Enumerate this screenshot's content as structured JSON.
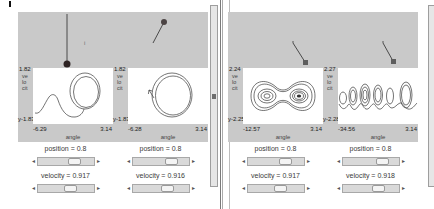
{
  "colors": {
    "canvas_bg": "#c9c9c9",
    "plot_bg": "#ffffff",
    "trace": "#3a3a3a",
    "slider_track": "#d9d9d9"
  },
  "canvas_annotation": "i",
  "ui": {
    "arrow_left": "◂",
    "arrow_right": "▸"
  },
  "panels": [
    {
      "plots": [
        {
          "y_max": "1.82",
          "ylabel_stack": "velocit",
          "ylabel_tail": "y",
          "y_min": "-1.83",
          "x_min": "-6.29",
          "x_max": "3.14",
          "xlabel": "angle"
        },
        {
          "y_max": "1.82",
          "ylabel_stack": "velocit",
          "ylabel_tail": "y",
          "y_min": "-1.83",
          "x_min": "-6.28",
          "x_max": "3.14",
          "xlabel": "angle"
        }
      ],
      "controls": [
        {
          "position": "position = 0.8",
          "velocity": "velocity = 0.917"
        },
        {
          "position": "position = 0.8",
          "velocity": "velocity = 0.916"
        }
      ]
    },
    {
      "plots": [
        {
          "y_max": "2.24",
          "ylabel_stack": "velocit",
          "ylabel_tail": "y",
          "y_min": "-2.25",
          "x_min": "-12.57",
          "x_max": "3.14",
          "xlabel": "angle"
        },
        {
          "y_max": "2.27",
          "ylabel_stack": "velocit",
          "ylabel_tail": "y",
          "y_min": "-2.28",
          "x_min": "-34.56",
          "x_max": "3.14",
          "xlabel": "angle"
        }
      ],
      "controls": [
        {
          "position": "position = 0.8",
          "velocity": "velocity = 0.917"
        },
        {
          "position": "position = 0.8",
          "velocity": "velocity = 0.918"
        }
      ]
    }
  ]
}
